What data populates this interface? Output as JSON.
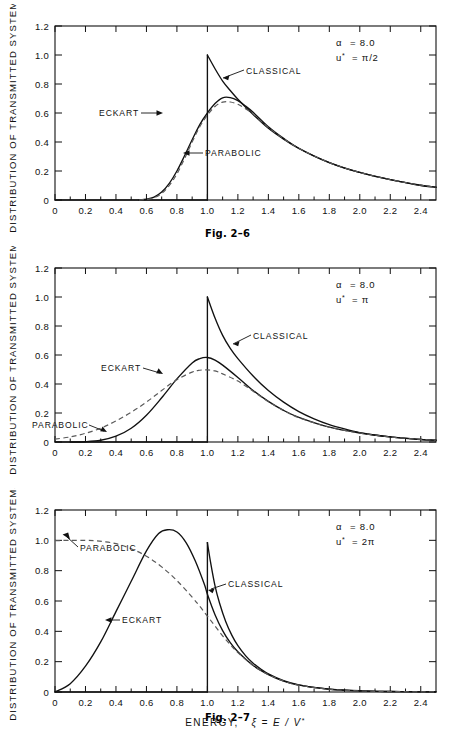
{
  "figure": {
    "y_axis_title": "DISTRIBUTION OF TRANSMITTED SYSTEMS",
    "x_axis_title_main": "ENERGY,",
    "x_axis_title_sym": "ξ = E / V",
    "x_axis_title_sup": "*"
  },
  "panels": [
    {
      "caption": "Fig. 2–6",
      "param_alpha": "α  =  8.0",
      "param_alpha_sym": "α",
      "param_alpha_val": "=  8.0",
      "param_u": "u*",
      "param_u_val": "=  π/2",
      "labels": {
        "classical": "CLASSICAL",
        "eckart": "ECKART",
        "parabolic": "PARABOLIC"
      }
    },
    {
      "caption": "Fig. 2–7",
      "param_alpha_sym": "α",
      "param_alpha_val": "=  8.0",
      "param_u": "u*",
      "param_u_val": "=  π",
      "labels": {
        "classical": "CLASSICAL",
        "eckart": "ECKART",
        "parabolic": "PARABOLIC"
      }
    },
    {
      "caption": "Fig. 2–8",
      "param_alpha_sym": "α",
      "param_alpha_val": "=  8.0",
      "param_u": "u*",
      "param_u_val": "=  2π",
      "labels": {
        "classical": "CLASSICAL",
        "eckart": "ECKART",
        "parabolic": "PARABOLIC"
      }
    }
  ],
  "axes": {
    "x_ticks": [
      "0",
      "0.2",
      "0.4",
      "0.6",
      "0.8",
      "1.0",
      "1.2",
      "1.4",
      "1.6",
      "1.8",
      "2.0",
      "2.2",
      "2.4"
    ],
    "x_tick_values": [
      0,
      0.2,
      0.4,
      0.6,
      0.8,
      1.0,
      1.2,
      1.4,
      1.6,
      1.8,
      2.0,
      2.2,
      2.4
    ],
    "y_ticks": [
      "0",
      "0.2",
      "0.4",
      "0.6",
      "0.8",
      "1.0",
      "1.2"
    ],
    "y_tick_values": [
      0,
      0.2,
      0.4,
      0.6,
      0.8,
      1.0,
      1.2
    ],
    "xlim": [
      0,
      2.5
    ],
    "ylim": [
      0,
      1.2
    ]
  },
  "chart_data": [
    {
      "type": "line",
      "title": "Fig. 2-6",
      "subtitle": "alpha = 8.0, u* = pi/2",
      "xlabel": "ENERGY, ξ = E / V*",
      "ylabel": "DISTRIBUTION OF TRANSMITTED SYSTEMS",
      "xlim": [
        0,
        2.5
      ],
      "ylim": [
        0,
        1.2
      ],
      "grid": false,
      "legend": "inline-annotations",
      "series": [
        {
          "name": "CLASSICAL",
          "style": "solid",
          "x": [
            0.0,
            0.2,
            0.4,
            0.6,
            0.8,
            0.95,
            1.0,
            1.0,
            1.05,
            1.1,
            1.15,
            1.2,
            1.3,
            1.4,
            1.5,
            1.6,
            1.7,
            1.8,
            1.9,
            2.0,
            2.1,
            2.2,
            2.3,
            2.4,
            2.5
          ],
          "y": [
            0.0,
            0.0,
            0.0,
            0.0,
            0.0,
            0.0,
            0.0,
            1.0,
            0.905,
            0.82,
            0.755,
            0.695,
            0.59,
            0.495,
            0.42,
            0.355,
            0.302,
            0.257,
            0.22,
            0.19,
            0.163,
            0.14,
            0.12,
            0.1,
            0.088
          ]
        },
        {
          "name": "ECKART",
          "style": "solid",
          "x": [
            0.55,
            0.6,
            0.65,
            0.7,
            0.75,
            0.8,
            0.85,
            0.9,
            0.95,
            1.0,
            1.05,
            1.1,
            1.15,
            1.2,
            1.25,
            1.3,
            1.4,
            1.5,
            1.6,
            1.8,
            2.0,
            2.2,
            2.4,
            2.5
          ],
          "y": [
            0.0,
            0.005,
            0.02,
            0.055,
            0.115,
            0.2,
            0.305,
            0.415,
            0.52,
            0.6,
            0.665,
            0.705,
            0.706,
            0.685,
            0.648,
            0.605,
            0.505,
            0.425,
            0.357,
            0.258,
            0.19,
            0.14,
            0.102,
            0.088
          ]
        },
        {
          "name": "PARABOLIC",
          "style": "dashed",
          "x": [
            0.55,
            0.6,
            0.65,
            0.7,
            0.75,
            0.8,
            0.85,
            0.9,
            0.95,
            1.0,
            1.05,
            1.1,
            1.15,
            1.2,
            1.25,
            1.3,
            1.4,
            1.5,
            1.6,
            1.8,
            2.0,
            2.2,
            2.4,
            2.5
          ],
          "y": [
            0.0,
            0.004,
            0.016,
            0.045,
            0.1,
            0.18,
            0.285,
            0.4,
            0.505,
            0.585,
            0.645,
            0.675,
            0.676,
            0.66,
            0.63,
            0.592,
            0.5,
            0.423,
            0.356,
            0.258,
            0.19,
            0.14,
            0.102,
            0.088
          ]
        }
      ],
      "annotations": [
        {
          "text": "CLASSICAL",
          "x": 1.38,
          "y": 0.83
        },
        {
          "text": "ECKART",
          "x": 0.52,
          "y": 0.555
        },
        {
          "text": "PARABOLIC",
          "x": 1.12,
          "y": 0.315
        }
      ]
    },
    {
      "type": "line",
      "title": "Fig. 2-7",
      "subtitle": "alpha = 8.0, u* = pi",
      "xlabel": "ENERGY, ξ = E / V*",
      "ylabel": "DISTRIBUTION OF TRANSMITTED SYSTEMS",
      "xlim": [
        0,
        2.5
      ],
      "ylim": [
        0,
        1.2
      ],
      "grid": false,
      "legend": "inline-annotations",
      "series": [
        {
          "name": "CLASSICAL",
          "style": "solid",
          "x": [
            0.0,
            0.5,
            1.0,
            1.0,
            1.05,
            1.1,
            1.15,
            1.2,
            1.3,
            1.4,
            1.5,
            1.6,
            1.7,
            1.8,
            1.9,
            2.0,
            2.1,
            2.2,
            2.3,
            2.4,
            2.5
          ],
          "y": [
            0.0,
            0.0,
            0.0,
            1.0,
            0.855,
            0.735,
            0.645,
            0.575,
            0.455,
            0.355,
            0.275,
            0.21,
            0.16,
            0.12,
            0.09,
            0.065,
            0.048,
            0.035,
            0.025,
            0.017,
            0.012
          ]
        },
        {
          "name": "ECKART",
          "style": "solid",
          "x": [
            0.1,
            0.2,
            0.3,
            0.4,
            0.5,
            0.6,
            0.7,
            0.8,
            0.9,
            0.95,
            1.0,
            1.05,
            1.1,
            1.2,
            1.3,
            1.4,
            1.5,
            1.6,
            1.8,
            2.0,
            2.2,
            2.4,
            2.5
          ],
          "y": [
            0.0,
            0.002,
            0.012,
            0.04,
            0.095,
            0.185,
            0.305,
            0.435,
            0.545,
            0.575,
            0.583,
            0.565,
            0.53,
            0.445,
            0.355,
            0.28,
            0.218,
            0.17,
            0.102,
            0.062,
            0.035,
            0.018,
            0.012
          ]
        },
        {
          "name": "PARABOLIC",
          "style": "dashed",
          "x": [
            0.0,
            0.1,
            0.2,
            0.3,
            0.4,
            0.5,
            0.6,
            0.7,
            0.8,
            0.9,
            0.95,
            1.0,
            1.05,
            1.1,
            1.2,
            1.3,
            1.4,
            1.5,
            1.6,
            1.8,
            2.0,
            2.2,
            2.4,
            2.5
          ],
          "y": [
            0.02,
            0.035,
            0.06,
            0.095,
            0.145,
            0.205,
            0.275,
            0.355,
            0.43,
            0.482,
            0.495,
            0.497,
            0.49,
            0.47,
            0.42,
            0.35,
            0.278,
            0.217,
            0.168,
            0.102,
            0.062,
            0.035,
            0.018,
            0.012
          ]
        }
      ],
      "annotations": [
        {
          "text": "CLASSICAL",
          "x": 1.42,
          "y": 0.665
        },
        {
          "text": "ECKART",
          "x": 0.52,
          "y": 0.49
        },
        {
          "text": "PARABOLIC",
          "x": 0.05,
          "y": 0.155
        }
      ]
    },
    {
      "type": "line",
      "title": "Fig. 2-8",
      "subtitle": "alpha = 8.0, u* = 2pi",
      "xlabel": "ENERGY, ξ = E / V*",
      "ylabel": "DISTRIBUTION OF TRANSMITTED SYSTEMS",
      "xlim": [
        0,
        2.5
      ],
      "ylim": [
        0,
        1.2
      ],
      "grid": false,
      "legend": "inline-annotations",
      "series": [
        {
          "name": "CLASSICAL",
          "style": "solid",
          "x": [
            0.0,
            0.5,
            1.0,
            1.0,
            1.02,
            1.05,
            1.08,
            1.12,
            1.16,
            1.2,
            1.25,
            1.3,
            1.35,
            1.4,
            1.5,
            1.6,
            1.7,
            1.8,
            1.9,
            2.0,
            2.2,
            2.4,
            2.5
          ],
          "y": [
            0.0,
            0.0,
            0.0,
            0.985,
            0.86,
            0.7,
            0.585,
            0.465,
            0.375,
            0.305,
            0.24,
            0.19,
            0.152,
            0.12,
            0.075,
            0.047,
            0.03,
            0.019,
            0.012,
            0.008,
            0.003,
            0.001,
            0.001
          ]
        },
        {
          "name": "ECKART",
          "style": "solid",
          "x": [
            0.0,
            0.1,
            0.2,
            0.3,
            0.4,
            0.5,
            0.6,
            0.68,
            0.74,
            0.8,
            0.86,
            0.92,
            0.98,
            1.0,
            1.05,
            1.1,
            1.15,
            1.2,
            1.3,
            1.4,
            1.5,
            1.6,
            1.8,
            2.0,
            2.2,
            2.4,
            2.5
          ],
          "y": [
            0.0,
            0.055,
            0.17,
            0.33,
            0.53,
            0.73,
            0.93,
            1.045,
            1.07,
            1.055,
            0.985,
            0.865,
            0.71,
            0.645,
            0.51,
            0.405,
            0.325,
            0.265,
            0.175,
            0.115,
            0.072,
            0.045,
            0.018,
            0.007,
            0.003,
            0.001,
            0.001
          ]
        },
        {
          "name": "PARABOLIC",
          "style": "dashed",
          "x": [
            0.0,
            0.1,
            0.2,
            0.26,
            0.32,
            0.4,
            0.5,
            0.6,
            0.7,
            0.8,
            0.9,
            0.95,
            1.0,
            1.05,
            1.1,
            1.15,
            1.2,
            1.3,
            1.4,
            1.5,
            1.6,
            1.8,
            2.0,
            2.2,
            2.4,
            2.5
          ],
          "y": [
            0.998,
            1.0,
            1.0,
            0.998,
            0.992,
            0.978,
            0.945,
            0.895,
            0.825,
            0.735,
            0.625,
            0.565,
            0.5,
            0.435,
            0.37,
            0.312,
            0.26,
            0.175,
            0.115,
            0.072,
            0.045,
            0.018,
            0.007,
            0.003,
            0.001,
            0.001
          ]
        }
      ],
      "annotations": [
        {
          "text": "PARABOLIC",
          "x": 0.22,
          "y": 0.875
        },
        {
          "text": "ECKART",
          "x": 0.52,
          "y": 0.415
        },
        {
          "text": "CLASSICAL",
          "x": 1.3,
          "y": 0.605
        }
      ]
    }
  ]
}
